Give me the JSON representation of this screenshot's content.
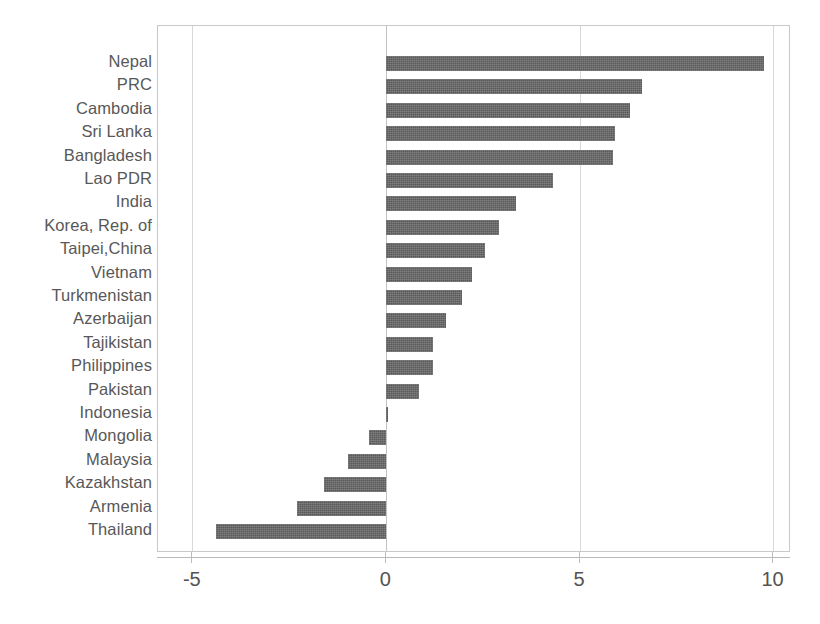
{
  "chart_data": {
    "type": "bar",
    "orientation": "horizontal",
    "title": "",
    "xlabel": "",
    "ylabel": "",
    "xlim": [
      -5.9,
      10.45
    ],
    "xticks": [
      -5,
      0,
      5,
      10
    ],
    "xtick_labels": [
      "-5",
      "0",
      "5",
      "10"
    ],
    "grid": true,
    "grid_axis": "x",
    "legend": "none",
    "bar_color": "#5a5a5a",
    "categories": [
      "Nepal",
      "PRC",
      "Cambodia",
      "Sri Lanka",
      "Bangladesh",
      "Lao PDR",
      "India",
      "Korea, Rep. of",
      "Taipei,China",
      "Vietnam",
      "Turkmenistan",
      "Azerbaijan",
      "Tajikistan",
      "Philippines",
      "Pakistan",
      "Indonesia",
      "Mongolia",
      "Malaysia",
      "Kazakhstan",
      "Armenia",
      "Thailand"
    ],
    "values": [
      9.75,
      6.6,
      6.3,
      5.9,
      5.85,
      4.3,
      3.35,
      2.9,
      2.55,
      2.2,
      1.95,
      1.55,
      1.2,
      1.2,
      0.85,
      0.05,
      -0.45,
      -1.0,
      -1.6,
      -2.3,
      -4.4
    ]
  }
}
